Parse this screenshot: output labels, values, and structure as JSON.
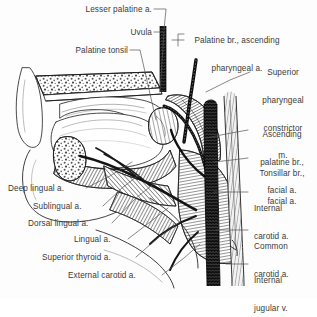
{
  "figure": {
    "background_color": "#fdfdfd",
    "ink_color": "#1d1d1d",
    "text_color": "#3a3a3a",
    "vessel_dark_color": "#101010",
    "vessel_light_color": "#e8e8e8"
  },
  "labels": {
    "left": [
      {
        "id": "lesser-palatine-a",
        "text": "Lesser palatine a.",
        "x": 66,
        "y": 10,
        "align": "right",
        "width": 86
      },
      {
        "id": "uvula",
        "text": "Uvula",
        "x": 102,
        "y": 33,
        "align": "right",
        "width": 50
      },
      {
        "id": "palatine-tonsil",
        "text": "Palatine tonsil",
        "x": 60,
        "y": 51,
        "align": "right",
        "width": 68
      },
      {
        "id": "deep-lingual-a",
        "text": "Deep lingual a.",
        "x": 8,
        "y": 189,
        "align": "left",
        "width": 76
      },
      {
        "id": "sublingual-a",
        "text": "Sublingual a.",
        "x": 33,
        "y": 207,
        "align": "left",
        "width": 68
      },
      {
        "id": "dorsal-lingual-a",
        "text": "Dorsal lingual a.",
        "x": 28,
        "y": 224,
        "align": "left",
        "width": 82
      },
      {
        "id": "lingual-a",
        "text": "Lingual a.",
        "x": 74,
        "y": 240,
        "align": "left",
        "width": 52
      },
      {
        "id": "superior-thyroid-a",
        "text": "Superior thyroid a.",
        "x": 42,
        "y": 258,
        "align": "left",
        "width": 92
      },
      {
        "id": "external-carotid-a",
        "text": "External carotid a.",
        "x": 68,
        "y": 276,
        "align": "left",
        "width": 92
      }
    ],
    "right": [
      {
        "id": "palatine-br-ascending-pharyngeal-a",
        "lines": [
          "Palatine br., ascending",
          "pharyngeal a."
        ],
        "x": 184,
        "y": 22,
        "width": 106,
        "align": "center"
      },
      {
        "id": "superior-pharyngeal-constrictor-m",
        "lines": [
          "Superior",
          "pharyngeal",
          "constrictor",
          "m."
        ],
        "x": 252,
        "y": 54,
        "width": 62,
        "align": "center"
      },
      {
        "id": "ascending-palatine-br-facial-a",
        "lines": [
          "Ascending",
          "palatine br.,",
          "facial a."
        ],
        "x": 250,
        "y": 116,
        "width": 64,
        "align": "center"
      },
      {
        "id": "tonsillar-br-facial-a",
        "lines": [
          "Tonsillar br.,",
          "facial a."
        ],
        "x": 250,
        "y": 155,
        "width": 64,
        "align": "center"
      },
      {
        "id": "internal-carotid-a",
        "lines": [
          "Internal",
          "carotid a."
        ],
        "x": 252,
        "y": 190,
        "width": 62,
        "align": "left"
      },
      {
        "id": "common-carotid-a",
        "lines": [
          "Common",
          "carotid a."
        ],
        "x": 252,
        "y": 228,
        "width": 62,
        "align": "left"
      },
      {
        "id": "internal-jugular-v",
        "lines": [
          "Internal",
          "jugular v."
        ],
        "x": 252,
        "y": 262,
        "width": 62,
        "align": "left"
      }
    ]
  }
}
